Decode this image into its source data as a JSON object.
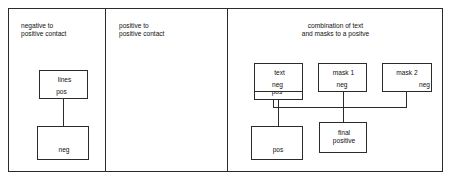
{
  "diagram": {
    "title_text_present": false,
    "colors": {
      "stroke": "#2b2b2b",
      "background": "#ffffff",
      "text": "#111111"
    },
    "panels": [
      {
        "id": "negative-to-positive-contact",
        "title": "negative to\npositive contact",
        "nodes": [
          {
            "id": "lines-pos",
            "lines": [
              "lines",
              "pos"
            ]
          },
          {
            "id": "neg",
            "lines": [
              "neg"
            ]
          }
        ],
        "connections": [
          {
            "from": "lines-pos",
            "to": "neg",
            "kind": "vertical"
          }
        ]
      },
      {
        "id": "positive-to-positive-contact",
        "title": "positive to\npositive contact",
        "nodes": [
          {
            "id": "lines-pos",
            "lines": [
              "lines",
              "pos"
            ]
          },
          {
            "id": "pos",
            "lines": [
              "pos"
            ]
          }
        ],
        "connections": [
          {
            "from": "lines-pos",
            "to": "pos",
            "kind": "vertical"
          }
        ]
      },
      {
        "id": "combination-of-text-and-masks",
        "title": "combination of text\nand masks to a positve",
        "nodes": [
          {
            "id": "text-neg",
            "lines": [
              "text",
              "neg"
            ]
          },
          {
            "id": "mask-1-neg",
            "lines": [
              "mask 1",
              "neg"
            ]
          },
          {
            "id": "mask-2-neg",
            "lines": [
              "mask 2",
              "neg"
            ]
          },
          {
            "id": "final-positive",
            "lines": [
              "final\npositive"
            ]
          }
        ],
        "connections": [
          {
            "from": "text-neg",
            "to": "bus",
            "kind": "vertical"
          },
          {
            "from": "mask-1-neg",
            "to": "final-positive",
            "kind": "vertical"
          },
          {
            "from": "mask-2-neg",
            "to": "bus",
            "kind": "vertical"
          },
          {
            "from": "bus",
            "to": "final-positive",
            "kind": "horizontal"
          }
        ]
      }
    ]
  }
}
